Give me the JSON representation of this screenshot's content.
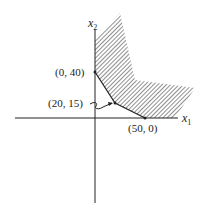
{
  "diagram": {
    "type": "feasible-region",
    "axes": {
      "x_label": "x",
      "x_subscript": "1",
      "y_label": "x",
      "y_subscript": "2"
    },
    "vertices": [
      {
        "label": "(0, 40)",
        "x": 0,
        "y": 40
      },
      {
        "label": "(20, 15)",
        "x": 20,
        "y": 15
      },
      {
        "label": "(50, 0)",
        "x": 50,
        "y": 0
      }
    ],
    "region": "unbounded hatched region above the boundary",
    "colors": {
      "ink": "#222222",
      "background": "#ffffff"
    }
  }
}
